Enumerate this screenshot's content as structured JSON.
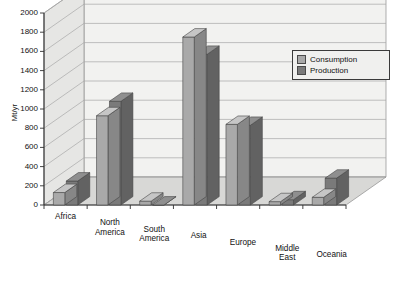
{
  "chart_data": {
    "type": "bar",
    "title": "",
    "subtitle": "",
    "xlabel": "",
    "ylabel": "Mt/yr",
    "ylim": [
      0,
      2000
    ],
    "ytick_step": 200,
    "yticks": [
      0,
      200,
      400,
      600,
      800,
      1000,
      1200,
      1400,
      1600,
      1800,
      2000
    ],
    "ytick_labels": [
      "0",
      "200",
      "400",
      "600",
      "800",
      "1000",
      "1200",
      "1400",
      "1600",
      "1800",
      "2000"
    ],
    "grid": true,
    "grid_axis": "y",
    "legend_position": "top-right",
    "projection": "3d",
    "categories": [
      "Africa",
      "North America",
      "South America",
      "Asia",
      "Europe",
      "Middle East",
      "Oceania"
    ],
    "category_label_lines": [
      [
        "Africa"
      ],
      [
        "North",
        "America"
      ],
      [
        "South",
        "America"
      ],
      [
        "Asia"
      ],
      [
        "Europe"
      ],
      [
        "Middle",
        "East"
      ],
      [
        "Oceania"
      ]
    ],
    "series": [
      {
        "name": "Consumption",
        "color": "#a9a9a9",
        "values": [
          130,
          930,
          40,
          1750,
          840,
          35,
          80
        ]
      },
      {
        "name": "Production",
        "color": "#7a7a7a",
        "values": [
          250,
          1080,
          0,
          1570,
          830,
          55,
          280
        ]
      }
    ]
  },
  "legend": {
    "items": [
      {
        "label": "Consumption",
        "color": "#a9a9a9"
      },
      {
        "label": "Production",
        "color": "#7a7a7a"
      }
    ]
  },
  "colors": {
    "consumption": "#a9a9a9",
    "production": "#7a7a7a",
    "plot_background": "#f2f2f0",
    "floor": "#d8d8d6",
    "wall_left": "#e6e6e4",
    "gridline": "#a8a8a8",
    "axis": "#303030",
    "text": "#111111"
  }
}
